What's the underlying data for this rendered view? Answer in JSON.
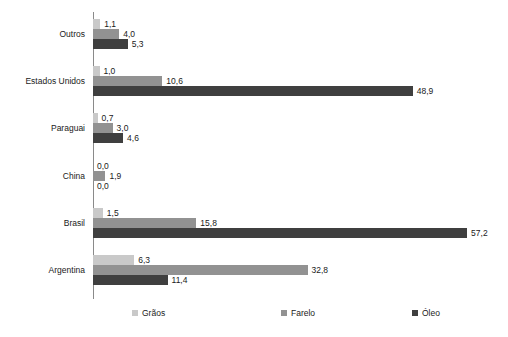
{
  "chart_data": {
    "type": "bar",
    "orientation": "horizontal",
    "title": "",
    "subtitle": "",
    "xlabel": "",
    "ylabel": "",
    "categories": [
      "Outros",
      "Estados Unidos",
      "Paraguai",
      "China",
      "Brasil",
      "Argentina"
    ],
    "series": [
      {
        "name": "Grãos",
        "color": "#c9c9c9",
        "values": [
          1.1,
          1.0,
          0.7,
          0.0,
          1.5,
          6.3
        ],
        "labels": [
          "1,1",
          "1,0",
          "0,7",
          "0,0",
          "1,5",
          "6,3"
        ]
      },
      {
        "name": "Farelo",
        "color": "#929292",
        "values": [
          4.0,
          10.6,
          3.0,
          1.9,
          15.8,
          32.8
        ],
        "labels": [
          "4,0",
          "10,6",
          "3,0",
          "1,9",
          "15,8",
          "32,8"
        ]
      },
      {
        "name": "Óleo",
        "color": "#3f3f3f",
        "values": [
          5.3,
          48.9,
          4.6,
          0.0,
          57.2,
          11.4
        ],
        "labels": [
          "5,3",
          "48,9",
          "4,6",
          "0,0",
          "57,2",
          "11,4"
        ]
      }
    ],
    "xlim": [
      0,
      63
    ],
    "grid": false,
    "legend": {
      "position": "bottom",
      "entries": [
        "Grãos",
        "Farelo",
        "Óleo"
      ]
    },
    "axis_color": "#8a8a8a",
    "value_label_decimal_separator": ","
  }
}
